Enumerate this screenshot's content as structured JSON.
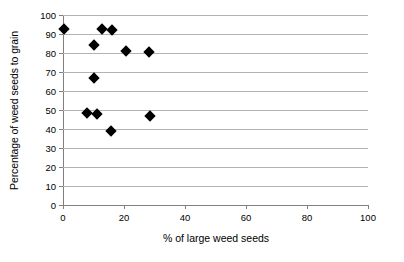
{
  "chart_data": {
    "type": "scatter",
    "title": "",
    "xlabel": "% of large weed seeds",
    "ylabel": "Percentage of weed seeds to grain",
    "xlim": [
      0,
      100
    ],
    "ylim": [
      0,
      100
    ],
    "xticks": [
      0,
      20,
      40,
      60,
      80,
      100
    ],
    "yticks": [
      0,
      10,
      20,
      30,
      40,
      50,
      60,
      70,
      80,
      90,
      100
    ],
    "grid": "horizontal",
    "legend": "none",
    "marker": "filled-diamond",
    "marker_color": "#000000",
    "series": [
      {
        "name": "weed seeds",
        "points": [
          {
            "x": 0.3,
            "y": 92.5
          },
          {
            "x": 12.8,
            "y": 92.5
          },
          {
            "x": 16.2,
            "y": 92.3
          },
          {
            "x": 10.0,
            "y": 84.0
          },
          {
            "x": 20.7,
            "y": 81.2
          },
          {
            "x": 28.3,
            "y": 80.3
          },
          {
            "x": 10.2,
            "y": 67.0
          },
          {
            "x": 7.8,
            "y": 48.2
          },
          {
            "x": 11.0,
            "y": 47.8
          },
          {
            "x": 28.5,
            "y": 46.7
          },
          {
            "x": 15.8,
            "y": 38.8
          }
        ]
      }
    ]
  },
  "axis_colors": {
    "gridline": "#b3b3b3",
    "axis": "#808080",
    "marker": "#000000",
    "background": "#ffffff"
  }
}
